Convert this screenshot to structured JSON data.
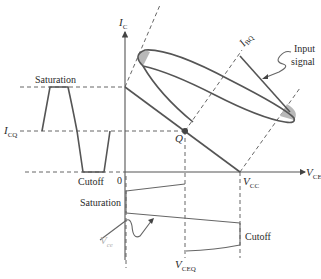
{
  "diagram": {
    "axes": {
      "y_label": "I",
      "y_label_sub": "C",
      "x_label": "V",
      "x_label_sub": "CE",
      "origin_label": "0"
    },
    "labels": {
      "saturation_left": "Saturation",
      "cutoff_left": "Cutoff",
      "icq": "I",
      "icq_sub": "CQ",
      "q_point": "Q",
      "ibq": "I",
      "ibq_sub": "BQ",
      "input_signal_line1": "Input",
      "input_signal_line2": "signal",
      "vcc": "V",
      "vcc_sub": "CC",
      "saturation_bottom": "Saturation",
      "cutoff_bottom": "Cutoff",
      "vce": "V",
      "vce_sub": "ce",
      "vceq": "V",
      "vceq_sub": "CEQ"
    },
    "colors": {
      "line": "#555555",
      "text": "#2b2b2b",
      "shaded": "#b8b8b8",
      "faded_label": "#b0b0b0"
    }
  }
}
